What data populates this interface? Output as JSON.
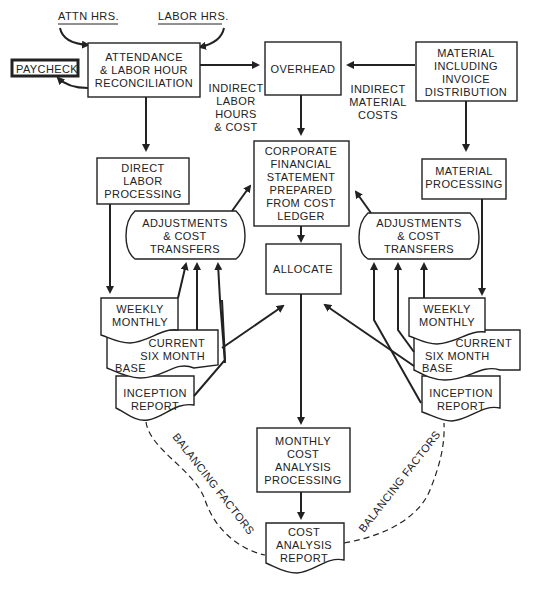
{
  "diagram": {
    "inputs": {
      "attn_hrs": "ATTN HRS.",
      "labor_hrs": "LABOR HRS."
    },
    "paycheck": "PAYCHECK",
    "attendance": [
      "ATTENDANCE",
      "& LABOR HOUR",
      "RECONCILIATION"
    ],
    "overhead": "OVERHEAD",
    "material": [
      "MATERIAL",
      "INCLUDING",
      "INVOICE",
      "DISTRIBUTION"
    ],
    "indirect_labor": [
      "INDIRECT",
      "LABOR",
      "HOURS",
      "& COST"
    ],
    "indirect_material": [
      "INDIRECT",
      "MATERIAL",
      "COSTS"
    ],
    "direct_labor": [
      "DIRECT",
      "LABOR",
      "PROCESSING"
    ],
    "corporate": [
      "CORPORATE",
      "FINANCIAL",
      "STATEMENT",
      "PREPARED",
      "FROM COST",
      "LEDGER"
    ],
    "material_processing": [
      "MATERIAL",
      "PROCESSING"
    ],
    "adjustments_left": [
      "ADJUSTMENTS",
      "& COST",
      "TRANSFERS"
    ],
    "adjustments_right": [
      "ADJUSTMENTS",
      "& COST",
      "TRANSFERS"
    ],
    "allocate": "ALLOCATE",
    "left_reports": {
      "weekly": [
        "WEEKLY",
        "MONTHLY"
      ],
      "current": [
        "CURRENT",
        "SIX MONTH"
      ],
      "base": "BASE",
      "inception": [
        "INCEPTION",
        "REPORT"
      ]
    },
    "right_reports": {
      "weekly": [
        "WEEKLY",
        "MONTHLY"
      ],
      "current": [
        "CURRENT",
        "SIX MONTH"
      ],
      "base": "BASE",
      "inception": [
        "INCEPTION",
        "REPORT"
      ]
    },
    "monthly": [
      "MONTHLY",
      "COST",
      "ANALYSIS",
      "PROCESSING"
    ],
    "cost_report": [
      "COST",
      "ANALYSIS",
      "REPORT"
    ],
    "balancing_left": "BALANCING FACTORS",
    "balancing_right": "BALANCING FACTORS"
  }
}
